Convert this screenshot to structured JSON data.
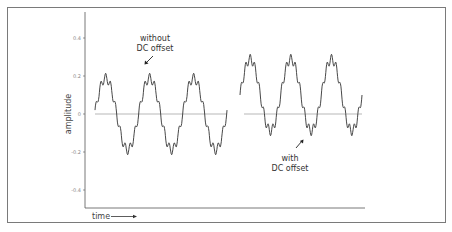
{
  "chart_data": {
    "type": "line",
    "title": "",
    "xlabel": "time",
    "ylabel": "amplitude",
    "ylim": [
      -0.5,
      0.5
    ],
    "yticks": [
      0.4,
      0.2,
      0,
      -0.2,
      -0.4
    ],
    "ytick_labels": [
      "0.4",
      "0.2",
      "0",
      "-0.2",
      "-0.4"
    ],
    "grid": false,
    "legend": null,
    "annotations": [
      {
        "text": "without\nDC offset",
        "target": "series 1"
      },
      {
        "text": "with\nDC offset",
        "target": "series 2"
      }
    ],
    "series": [
      {
        "name": "without DC offset",
        "description": "sine wave with small high-frequency ripple, centered on 0",
        "cycles": 3,
        "dc_offset": 0.0,
        "peak": 0.22,
        "trough": -0.21
      },
      {
        "name": "with DC offset",
        "description": "same waveform shifted upward, centered near 0.1",
        "cycles": 3,
        "dc_offset": 0.1,
        "peak": 0.38,
        "trough": -0.05
      }
    ],
    "colors": {
      "line": "#333333",
      "zero_line": "#999999",
      "axis": "#555555",
      "frame": "#7a7a7a"
    }
  },
  "labels": {
    "ylabel": "amplitude",
    "xlabel": "time",
    "annot1_line1": "without",
    "annot1_line2": "DC offset",
    "annot2_line1": "with",
    "annot2_line2": "DC offset",
    "tick_04": "0.4",
    "tick_02": "0.2",
    "tick_0": "0",
    "tick_m02": "-0.2",
    "tick_m04": "-0.4"
  }
}
